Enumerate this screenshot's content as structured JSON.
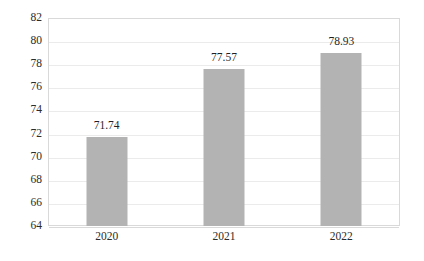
{
  "chart_data": {
    "type": "bar",
    "title": "",
    "subtitle": "",
    "xlabel": "",
    "ylabel": "",
    "categories": [
      "2020",
      "2021",
      "2022"
    ],
    "values": [
      71.74,
      77.57,
      78.93
    ],
    "data_labels": [
      "71.74",
      "77.57",
      "78.93"
    ],
    "ylim": [
      64,
      82
    ],
    "ytick_step": 2,
    "ytick_labels": [
      "64",
      "66",
      "68",
      "70",
      "72",
      "74",
      "76",
      "78",
      "80",
      "82"
    ],
    "grid": true,
    "grid_axis": "y",
    "legend": false,
    "legend_position": "none",
    "bar_color": "#b3b3b3",
    "gridline_color": "#ebebeb",
    "plot_border_color": "#d9d9d9",
    "label_text_color": "#2b2b2b",
    "background_color": "#ffffff"
  }
}
